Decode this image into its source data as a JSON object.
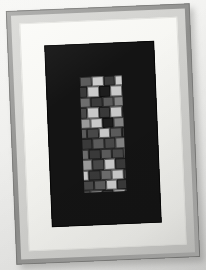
{
  "scene": {
    "title": "Framed mosaic tile artwork",
    "background_color": "#f2f2f0",
    "rotation_degrees": -2.4
  },
  "frame": {
    "outer_moulding_color": "#8e8e8c",
    "moulding_lip_color": "#d9d9d6",
    "mat_color": "#f7f7f3",
    "inner_border_color": "#141414",
    "shadow_color": "#9a9a98"
  },
  "artwork": {
    "name": "grayscale-brick-mosaic",
    "style": "staggered brick grid",
    "columns": 11,
    "rows": 19,
    "tile_width": 11.8,
    "tile_height": 10.4,
    "palette": {
      "near-black": "#1d1d1d",
      "very-dark": "#2b2b2b",
      "dark": "#3a3a3a",
      "dark-mid": "#494949",
      "mid": "#5c5c5c",
      "mid-light": "#6e6e6e",
      "light-mid": "#848484",
      "light": "#9b9b9b",
      "pale": "#b4b4b4",
      "very-pale": "#cbcbcb",
      "near-white": "#dedede"
    },
    "rows_data": [
      {
        "offset": 0,
        "tiles": [
          "mid",
          "very-pale",
          "dark",
          "very-pale",
          "dark-mid",
          "mid",
          "light-mid",
          "near-white",
          "mid",
          "dark",
          "near-white"
        ]
      },
      {
        "offset": -5,
        "tiles": [
          "dark",
          "very-pale",
          "near-black",
          "very-pale",
          "mid",
          "dark-mid",
          "light-mid",
          "mid",
          "dark-mid",
          "light",
          "mid"
        ]
      },
      {
        "offset": -2,
        "tiles": [
          "mid-light",
          "dark",
          "mid",
          "light-mid",
          "dark-mid",
          "very-pale",
          "mid",
          "pale",
          "dark",
          "light-mid",
          "dark-mid"
        ]
      },
      {
        "offset": -6,
        "tiles": [
          "dark-mid",
          "very-pale",
          "dark",
          "very-pale",
          "dark-mid",
          "mid",
          "light-mid",
          "mid",
          "very-pale",
          "dark",
          "mid"
        ]
      },
      {
        "offset": -3,
        "tiles": [
          "light",
          "very-pale",
          "near-black",
          "light-mid",
          "dark-mid",
          "very-pale",
          "mid",
          "dark",
          "near-white",
          "dark",
          "light-mid"
        ]
      },
      {
        "offset": -7,
        "tiles": [
          "mid",
          "dark-mid",
          "very-pale",
          "mid",
          "dark",
          "mid-light",
          "dark-mid",
          "light-mid",
          "mid",
          "dark",
          "pale"
        ]
      },
      {
        "offset": -2,
        "tiles": [
          "dark",
          "mid",
          "dark-mid",
          "light-mid",
          "mid",
          "dark",
          "very-pale",
          "mid",
          "light",
          "dark-mid",
          "light-mid"
        ]
      },
      {
        "offset": -6,
        "tiles": [
          "mid-light",
          "dark",
          "mid",
          "dark-mid",
          "light-mid",
          "mid",
          "dark",
          "near-white",
          "dark-mid",
          "very-pale",
          "mid"
        ]
      },
      {
        "offset": -3,
        "tiles": [
          "light",
          "dark-mid",
          "very-pale",
          "dark",
          "light-mid",
          "mid",
          "dark-mid",
          "mid",
          "light",
          "dark",
          "mid-light"
        ]
      },
      {
        "offset": -7,
        "tiles": [
          "very-pale",
          "dark",
          "mid-light",
          "very-pale",
          "dark-mid",
          "mid",
          "light-mid",
          "dark",
          "mid",
          "pale",
          "dark-mid"
        ]
      },
      {
        "offset": -2,
        "tiles": [
          "dark-mid",
          "mid",
          "very-pale",
          "dark",
          "mid-light",
          "light",
          "dark-mid",
          "mid",
          "very-pale",
          "dark",
          "mid"
        ]
      },
      {
        "offset": -6,
        "tiles": [
          "mid",
          "light-mid",
          "dark",
          "very-pale",
          "mid",
          "dark-mid",
          "light",
          "near-white",
          "dark",
          "mid",
          "pale"
        ]
      },
      {
        "offset": -3,
        "tiles": [
          "light-mid",
          "dark-mid",
          "mid",
          "dark",
          "pale",
          "mid",
          "dark-mid",
          "light-mid",
          "mid",
          "very-pale",
          "dark"
        ]
      },
      {
        "offset": -7,
        "tiles": [
          "mid",
          "very-pale",
          "dark",
          "light",
          "dark-mid",
          "mid-light",
          "mid",
          "dark",
          "light-mid",
          "mid",
          "dark-mid"
        ]
      },
      {
        "offset": -2,
        "tiles": [
          "dark-mid",
          "light-mid",
          "very-pale",
          "mid",
          "dark",
          "light",
          "mid-light",
          "dark-mid",
          "very-pale",
          "mid",
          "light"
        ]
      },
      {
        "offset": -6,
        "tiles": [
          "mid",
          "dark",
          "light-mid",
          "mid",
          "pale",
          "dark-mid",
          "mid",
          "light",
          "dark",
          "mid-light",
          "dark-mid"
        ]
      },
      {
        "offset": -3,
        "tiles": [
          "light",
          "very-pale",
          "dark-mid",
          "mid",
          "dark",
          "light-mid",
          "mid",
          "near-white",
          "dark",
          "mid",
          "pale"
        ]
      },
      {
        "offset": -7,
        "tiles": [
          "mid-light",
          "mid",
          "very-pale",
          "dark",
          "mid",
          "light-mid",
          "dark-mid",
          "mid",
          "near-white",
          "dark-mid",
          "mid"
        ]
      },
      {
        "offset": -2,
        "tiles": [
          "dark-mid",
          "mid",
          "light-mid",
          "mid",
          "dark",
          "light",
          "mid-light",
          "pale",
          "dark",
          "mid",
          "light-mid"
        ]
      }
    ]
  }
}
